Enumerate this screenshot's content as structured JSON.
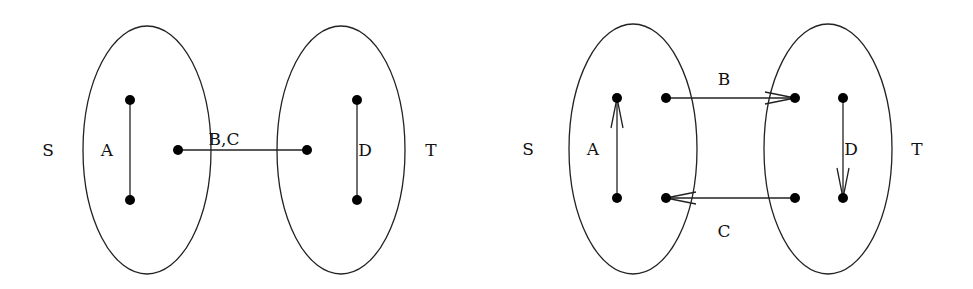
{
  "figures": [
    {
      "name": "undirected",
      "sets": [
        {
          "label": "S",
          "cx": 147,
          "cy": 150,
          "rx": 64,
          "ry": 124,
          "label_x": 48,
          "label_y": 151
        },
        {
          "label": "T",
          "cx": 341,
          "cy": 150,
          "rx": 64,
          "ry": 124,
          "label_x": 431,
          "label_y": 151
        }
      ],
      "nodes": [
        {
          "id": "s1",
          "x": 130,
          "y": 100
        },
        {
          "id": "s2",
          "x": 130,
          "y": 200
        },
        {
          "id": "s3",
          "x": 178,
          "y": 150
        },
        {
          "id": "t1",
          "x": 307,
          "y": 150
        },
        {
          "id": "t2",
          "x": 357,
          "y": 100
        },
        {
          "id": "t3",
          "x": 357,
          "y": 200
        }
      ],
      "edges": [
        {
          "label": "A",
          "from": "s1",
          "to": "s2",
          "label_x": 107,
          "label_y": 151
        },
        {
          "label": "B,C",
          "from": "s3",
          "to": "t1",
          "label_x": 224,
          "label_y": 140
        },
        {
          "label": "D",
          "from": "t2",
          "to": "t3",
          "label_x": 365,
          "label_y": 151
        }
      ]
    },
    {
      "name": "directed",
      "sets": [
        {
          "label": "S",
          "cx": 633,
          "cy": 149,
          "rx": 64,
          "ry": 125,
          "label_x": 528,
          "label_y": 150
        },
        {
          "label": "T",
          "cx": 828,
          "cy": 149,
          "rx": 64,
          "ry": 125,
          "label_x": 917,
          "label_y": 150
        }
      ],
      "nodes": [
        {
          "id": "s1",
          "x": 617,
          "y": 98
        },
        {
          "id": "s2",
          "x": 617,
          "y": 198
        },
        {
          "id": "s3",
          "x": 666,
          "y": 98
        },
        {
          "id": "s4",
          "x": 666,
          "y": 198
        },
        {
          "id": "t1",
          "x": 795,
          "y": 98
        },
        {
          "id": "t2",
          "x": 795,
          "y": 198
        },
        {
          "id": "t3",
          "x": 843,
          "y": 98
        },
        {
          "id": "t4",
          "x": 843,
          "y": 198
        }
      ],
      "edges": [
        {
          "label": "A",
          "from": "s2",
          "to": "s1",
          "label_x": 593,
          "label_y": 150
        },
        {
          "label": "B",
          "from": "s3",
          "to": "t1",
          "label_x": 724,
          "label_y": 80
        },
        {
          "label": "C",
          "from": "t2",
          "to": "s4",
          "label_x": 724,
          "label_y": 232
        },
        {
          "label": "D",
          "from": "t3",
          "to": "t4",
          "label_x": 851,
          "label_y": 150
        }
      ]
    }
  ]
}
